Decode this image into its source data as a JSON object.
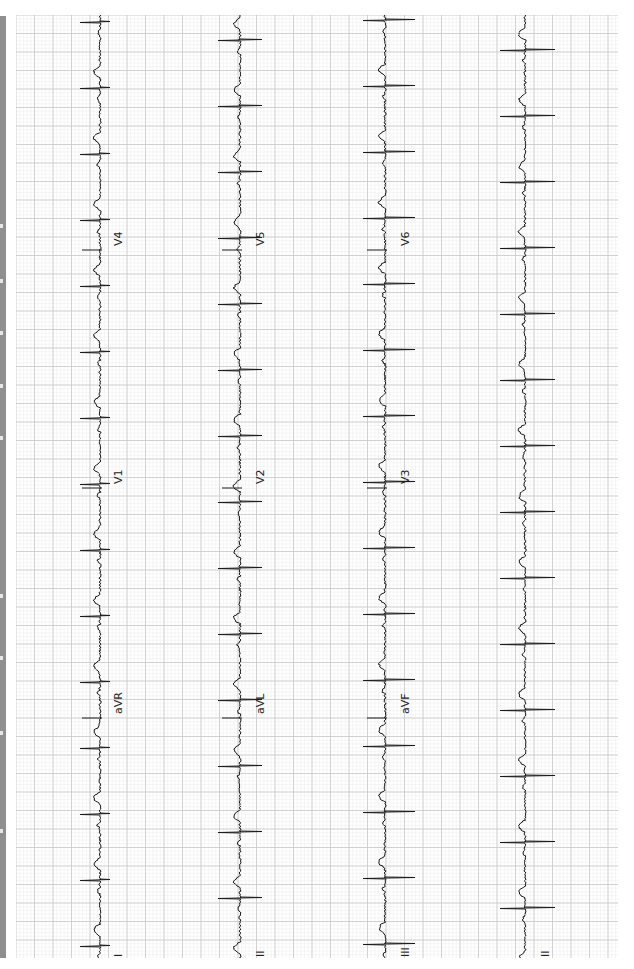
{
  "document": {
    "type": "12-lead ECG printout (rotated 90°)",
    "orientation": "time axis runs bottom-to-top"
  },
  "colors": {
    "grid_minor": "#ececec",
    "grid_major": "#c8c8c8",
    "trace": "#1a1a1a",
    "side_strip": "#8f8f8f",
    "background": "#ffffff"
  },
  "rows": [
    {
      "baseline_x": 100,
      "leads": [
        "I",
        "aVR",
        "V1",
        "V4"
      ]
    },
    {
      "baseline_x": 240,
      "leads": [
        "II",
        "aVL",
        "V2",
        "V5"
      ]
    },
    {
      "baseline_x": 385,
      "leads": [
        "III",
        "aVF",
        "V3",
        "V6"
      ]
    },
    {
      "baseline_x": 525,
      "leads": [
        "II"
      ],
      "rhythm_strip": true
    }
  ],
  "labels": {
    "r0_c0": "I",
    "r0_c1": "aVR",
    "r0_c2": "V1",
    "r0_c3": "V4",
    "r1_c0": "II",
    "r1_c1": "aVL",
    "r1_c2": "V2",
    "r1_c3": "V5",
    "r2_c0": "III",
    "r2_c1": "aVF",
    "r2_c2": "V3",
    "r2_c3": "V6",
    "r3_c0": "II"
  }
}
